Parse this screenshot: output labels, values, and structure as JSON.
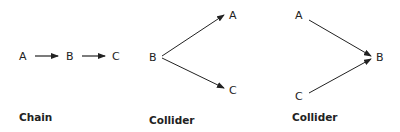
{
  "diagrams": [
    {
      "title": "Chain",
      "nodes": [
        {
          "id": "A",
          "label": "A"
        },
        {
          "id": "B",
          "label": "B"
        },
        {
          "id": "C",
          "label": "C"
        }
      ],
      "edges": [
        [
          "A",
          "B"
        ],
        [
          "B",
          "C"
        ]
      ]
    },
    {
      "title": "Fork",
      "nodes": [
        {
          "id": "B",
          "label": "B"
        },
        {
          "id": "A",
          "label": "A"
        },
        {
          "id": "C",
          "label": "C"
        }
      ],
      "edges": [
        [
          "B",
          "A"
        ],
        [
          "B",
          "C"
        ]
      ]
    },
    {
      "title": "Collider",
      "nodes": [
        {
          "id": "A",
          "label": "A"
        },
        {
          "id": "C",
          "label": "C"
        },
        {
          "id": "B",
          "label": "B"
        }
      ],
      "edges": [
        [
          "A",
          "B"
        ],
        [
          "C",
          "B"
        ]
      ]
    }
  ]
}
